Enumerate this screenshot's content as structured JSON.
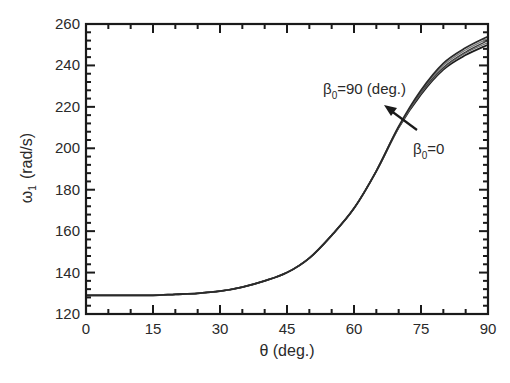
{
  "chart_data": {
    "type": "line",
    "title": "",
    "xlabel": "θ (deg.)",
    "ylabel": "ω1 (rad/s)",
    "ylabel_main": "ω",
    "ylabel_sub": "1",
    "ylabel_unit": "(rad/s)",
    "xlim": [
      0,
      90
    ],
    "ylim": [
      120,
      260
    ],
    "xticks": [
      0,
      15,
      30,
      45,
      60,
      75,
      90
    ],
    "yticks": [
      120,
      140,
      160,
      180,
      200,
      220,
      240,
      260
    ],
    "grid": false,
    "legend": null,
    "x": [
      0,
      5,
      10,
      15,
      20,
      25,
      30,
      35,
      40,
      45,
      50,
      55,
      60,
      65,
      70,
      75,
      80,
      85,
      90
    ],
    "series": [
      {
        "name": "β0=0",
        "values": [
          129,
          129,
          129,
          129,
          129.5,
          130,
          131,
          133,
          136,
          140,
          147,
          158,
          171,
          189,
          210,
          226,
          238,
          245,
          250
        ]
      },
      {
        "name": "β0 intermediate 1",
        "values": [
          129,
          129,
          129,
          129,
          129.5,
          130,
          131,
          133,
          136,
          140,
          147,
          158,
          171,
          189,
          210,
          226.5,
          238.5,
          246,
          251
        ]
      },
      {
        "name": "β0 intermediate 2",
        "values": [
          129,
          129,
          129,
          129,
          129.5,
          130,
          131,
          133,
          136,
          140,
          147,
          158,
          171,
          189,
          210,
          227,
          239,
          246.5,
          252
        ]
      },
      {
        "name": "β0 intermediate 3",
        "values": [
          129,
          129,
          129,
          129,
          129.5,
          130,
          131,
          133,
          136,
          140,
          147,
          158,
          171,
          189,
          210,
          227.5,
          240,
          247.5,
          253
        ]
      },
      {
        "name": "β0=90 (deg.)",
        "values": [
          129,
          129,
          129,
          129,
          129.5,
          130,
          131,
          133,
          136,
          140,
          147,
          158,
          171,
          189,
          210.5,
          228,
          241,
          248.5,
          254
        ]
      }
    ],
    "annotations": [
      {
        "text": "β0=90 (deg.)",
        "main": "β",
        "sub": "0",
        "rest": "=90 (deg.)",
        "x_px": 323,
        "y_px": 94
      },
      {
        "text": "β0=0",
        "main": "β",
        "sub": "0",
        "rest": "=0",
        "x_px": 413,
        "y_px": 154
      },
      {
        "type": "arrow",
        "from_px": [
          417,
          130
        ],
        "to_px": [
          386,
          107
        ],
        "direction": "from β0=0 toward β0=90"
      }
    ]
  }
}
